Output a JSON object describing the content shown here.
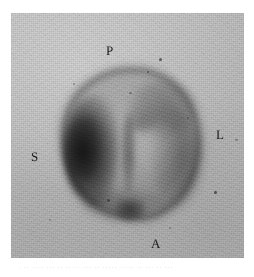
{
  "figure": {
    "modality_description": "grayscale transverse tomographic scan",
    "panel_background_color": "#bcbcbc",
    "page_background_color": "#ffffff",
    "ink_color": "#1a1a1a"
  },
  "orientation_labels": [
    {
      "key": "posterior",
      "text": "P",
      "position": "top"
    },
    {
      "key": "superior",
      "text": "S",
      "position": "left"
    },
    {
      "key": "lateral",
      "text": "L",
      "position": "right"
    },
    {
      "key": "anterior",
      "text": "A",
      "position": "bottom"
    }
  ],
  "scan": {
    "structure_name": "rounded cross-sectional organ",
    "regions": [
      {
        "name": "high-uptake-crescent",
        "location": "left (S side)",
        "relative_intensity": "darkest"
      },
      {
        "name": "lateral-wall-uptake",
        "location": "right (L side)",
        "relative_intensity": "moderate"
      },
      {
        "name": "posterior-wall-uptake",
        "location": "upper right",
        "relative_intensity": "moderate"
      },
      {
        "name": "midline-septum",
        "location": "center",
        "relative_intensity": "moderate"
      },
      {
        "name": "central-cavity",
        "location": "center right",
        "relative_intensity": "low"
      },
      {
        "name": "apical-focus",
        "location": "inferior (A side)",
        "relative_intensity": "dark"
      }
    ]
  },
  "bleed_text": "· ·· ···· ··· ·· ····· ··· ·· ····· ····· ·· ··· ·· ···"
}
